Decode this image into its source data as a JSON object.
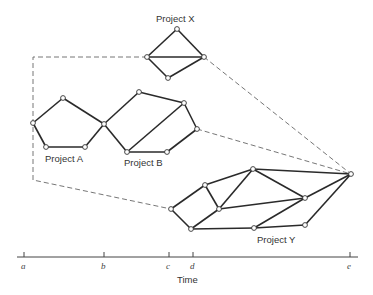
{
  "diagram": {
    "projects": [
      {
        "name": "Project X",
        "label_pos": [
          160,
          22
        ]
      },
      {
        "name": "Project A",
        "label_pos": [
          45,
          162
        ]
      },
      {
        "name": "Project B",
        "label_pos": [
          124,
          166
        ]
      },
      {
        "name": "Project Y",
        "label_pos": [
          257,
          243
        ]
      }
    ],
    "axis": {
      "label": "Time",
      "ticks": [
        {
          "label": "a",
          "x": 24
        },
        {
          "label": "b",
          "x": 104
        },
        {
          "label": "c",
          "x": 169
        },
        {
          "label": "d",
          "x": 193
        },
        {
          "label": "e",
          "x": 350
        }
      ]
    }
  }
}
